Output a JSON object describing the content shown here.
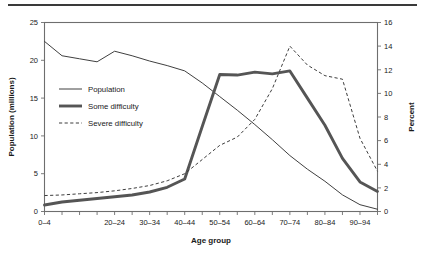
{
  "figure": {
    "top_rule": "rule",
    "title_partial": ""
  },
  "chart_data": {
    "type": "line",
    "title": "",
    "xlabel": "Age group",
    "ylabel": "Population (millions)",
    "y2label": "Percent",
    "grid": false,
    "legend_position": "inside-upper-left",
    "categories": [
      "0–4",
      "5–9",
      "10–14",
      "15–19",
      "20–24",
      "25–29",
      "30–34",
      "35–39",
      "40–44",
      "45–49",
      "50–54",
      "55–59",
      "60–64",
      "65–69",
      "70–74",
      "75–79",
      "80–84",
      "85–89",
      "90–94",
      "95+"
    ],
    "xtick_labels": [
      "0–4",
      "20–24",
      "30–34",
      "40–44",
      "50–54",
      "60–64",
      "70–74",
      "80–84",
      "90–94"
    ],
    "xtick_indices": [
      0,
      4,
      6,
      8,
      10,
      12,
      14,
      16,
      18
    ],
    "ylim": [
      0,
      25
    ],
    "ytick_labels": [
      "0",
      "5",
      "10",
      "15",
      "20",
      "25"
    ],
    "ytick_values": [
      0,
      5,
      10,
      15,
      20,
      25
    ],
    "y2lim": [
      0,
      16
    ],
    "y2tick_labels": [
      "0",
      "2",
      "4",
      "6",
      "8",
      "10",
      "12",
      "14",
      "16"
    ],
    "y2tick_values": [
      0,
      2,
      4,
      6,
      8,
      10,
      12,
      14,
      16
    ],
    "series": [
      {
        "name": "Population",
        "axis": "left",
        "units": "millions",
        "style": "thin-solid",
        "color": "#404040",
        "values": [
          22.5,
          20.6,
          20.2,
          19.8,
          21.2,
          20.6,
          19.9,
          19.3,
          18.6,
          17.0,
          15.2,
          13.4,
          11.5,
          9.5,
          7.4,
          5.6,
          4.0,
          2.2,
          0.9,
          0.3
        ]
      },
      {
        "name": "Some difficulty",
        "axis": "right",
        "units": "percent",
        "style": "thick-solid",
        "color": "#555555",
        "values": [
          0.55,
          0.8,
          0.95,
          1.1,
          1.25,
          1.4,
          1.65,
          2.05,
          2.75,
          7.2,
          11.6,
          11.55,
          11.8,
          11.65,
          11.9,
          9.6,
          7.3,
          4.5,
          2.5,
          1.7
        ],
        "values_right_axis_note": "percent"
      },
      {
        "name": "Severe difficulty",
        "axis": "right",
        "units": "percent",
        "style": "dashed",
        "color": "#3d3d3d",
        "values": [
          1.35,
          1.4,
          1.5,
          1.6,
          1.75,
          1.95,
          2.2,
          2.6,
          3.2,
          4.4,
          5.6,
          6.3,
          7.8,
          10.4,
          14.0,
          12.4,
          11.5,
          11.2,
          6.2,
          3.4
        ]
      }
    ],
    "legend": [
      {
        "label": "Population",
        "style": "thin-solid"
      },
      {
        "label": "Some difficulty",
        "style": "thick-solid"
      },
      {
        "label": "Severe difficulty",
        "style": "dashed"
      }
    ]
  }
}
